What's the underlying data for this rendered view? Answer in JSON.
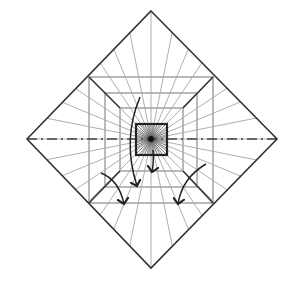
{
  "diagram": {
    "type": "origami-crease-pattern",
    "center": [
      151,
      139
    ],
    "diamond": {
      "top": [
        151,
        11
      ],
      "right": [
        277,
        139
      ],
      "bottom": [
        151,
        268
      ],
      "left": [
        27,
        139
      ]
    },
    "squares": [
      {
        "name": "outer-square",
        "x1": 89,
        "y1": 77,
        "x2": 213,
        "y2": 203
      },
      {
        "name": "middle-square",
        "x1": 105,
        "y1": 93,
        "x2": 197,
        "y2": 187
      },
      {
        "name": "inner-square",
        "x1": 120,
        "y1": 108,
        "x2": 183,
        "y2": 171
      },
      {
        "name": "core-square",
        "x1": 136,
        "y1": 124,
        "x2": 167,
        "y2": 155
      }
    ],
    "ray_count": 32,
    "colors": {
      "edge": "#333333",
      "crease": "#9a9a9a",
      "fold": "#222222"
    },
    "arrows": [
      {
        "name": "arrow-long-center",
        "path": "M140,97 Q122,140 137,186"
      },
      {
        "name": "arrow-short-center",
        "path": "M153,150 Q154,162 152,172"
      },
      {
        "name": "arrow-left",
        "path": "M101,173 Q119,180 124,204"
      },
      {
        "name": "arrow-right",
        "path": "M206,164 Q182,178 178,204"
      }
    ]
  }
}
